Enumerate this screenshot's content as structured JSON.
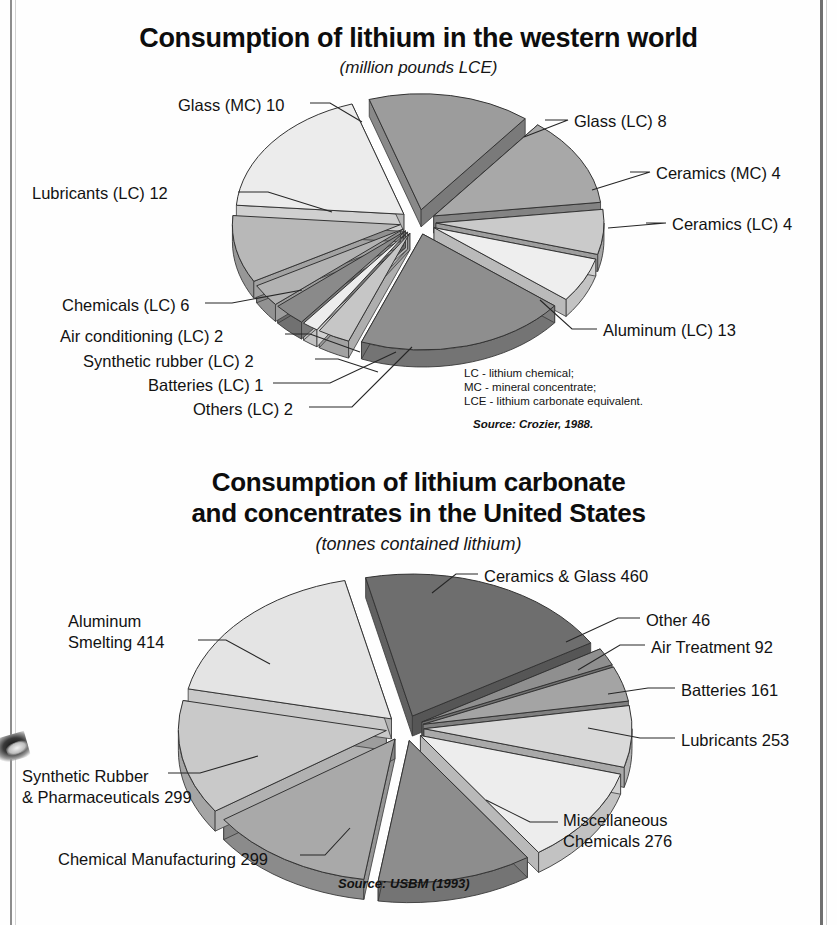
{
  "page": {
    "charts": [
      {
        "title": "Consumption of lithium in the western world",
        "subtitle": "(million pounds LCE)",
        "source": "Source: Crozier, 1988.",
        "note": "LC - lithium chemical;\nMC - mineral concentrate;\nLCE - lithium carbonate equivalent.",
        "labels": {
          "glass_mc": "Glass (MC) 10",
          "lubricants": "Lubricants (LC) 12",
          "chemicals": "Chemicals (LC) 6",
          "air_conditioning": "Air conditioning (LC) 2",
          "synthetic_rubber": "Synthetic rubber (LC) 2",
          "batteries": "Batteries (LC) 1",
          "others": "Others (LC) 2",
          "glass_lc": "Glass (LC) 8",
          "ceramics_mc": "Ceramics (MC) 4",
          "ceramics_lc": "Ceramics (LC) 4",
          "aluminum": "Aluminum (LC) 13"
        }
      },
      {
        "title_line1": "Consumption of lithium carbonate",
        "title_line2": "and concentrates in the United States",
        "subtitle": "(tonnes contained lithium)",
        "source": "Source: USBM (1993)",
        "labels": {
          "ceramics_glass": "Ceramics & Glass 460",
          "other": "Other 46",
          "air_treatment": "Air Treatment 92",
          "batteries": "Batteries 161",
          "lubricants": "Lubricants 253",
          "misc_chem_l1": "Miscellaneous",
          "misc_chem_l2": "Chemicals 276",
          "chem_mfg": "Chemical Manufacturing 299",
          "syn_rubber_l1": "Synthetic Rubber",
          "syn_rubber_l2": "& Pharmaceuticals 299",
          "aluminum_l1": "Aluminum",
          "aluminum_l2": "Smelting 414"
        }
      }
    ]
  },
  "chart_data": [
    {
      "type": "pie",
      "title": "Consumption of lithium in the western world",
      "subtitle": "(million pounds LCE)",
      "unit": "million pounds LCE",
      "exploded": true,
      "three_d": true,
      "source": "Crozier, 1988",
      "categories": [
        "Glass (MC)",
        "Glass (LC)",
        "Ceramics (MC)",
        "Ceramics (LC)",
        "Aluminum (LC)",
        "Others (LC)",
        "Batteries (LC)",
        "Synthetic rubber (LC)",
        "Air conditioning (LC)",
        "Chemicals (LC)",
        "Lubricants (LC)"
      ],
      "values": [
        10,
        8,
        4,
        4,
        13,
        2,
        1,
        2,
        2,
        6,
        12
      ],
      "slices": [
        {
          "label": "Glass (MC) 10",
          "name": "Glass (MC)",
          "value": 10,
          "color": "#9c9c9c"
        },
        {
          "label": "Glass (LC) 8",
          "name": "Glass (LC)",
          "value": 8,
          "color": "#a8a8a8"
        },
        {
          "label": "Ceramics (MC) 4",
          "name": "Ceramics (MC)",
          "value": 4,
          "color": "#cacaca"
        },
        {
          "label": "Ceramics (LC) 4",
          "name": "Ceramics (LC)",
          "value": 4,
          "color": "#eeeeee"
        },
        {
          "label": "Aluminum (LC) 13",
          "name": "Aluminum (LC)",
          "value": 13,
          "color": "#8e8e8e"
        },
        {
          "label": "Others (LC) 2",
          "name": "Others (LC)",
          "value": 2,
          "color": "#c6c6c6"
        },
        {
          "label": "Batteries (LC) 1",
          "name": "Batteries (LC)",
          "value": 1,
          "color": "#ededed"
        },
        {
          "label": "Synthetic rubber (LC) 2",
          "name": "Synthetic rubber (LC)",
          "value": 2,
          "color": "#8a8a8a"
        },
        {
          "label": "Air conditioning (LC) 2",
          "name": "Air conditioning (LC)",
          "value": 2,
          "color": "#b2b2b2"
        },
        {
          "label": "Chemicals (LC) 6",
          "name": "Chemicals (LC)",
          "value": 6,
          "color": "#b8b8b8"
        },
        {
          "label": "Lubricants (LC) 12",
          "name": "Lubricants (LC)",
          "value": 12,
          "color": "#ececec"
        }
      ],
      "total": 64,
      "legend_note": "LC - lithium chemical; MC - mineral concentrate; LCE - lithium carbonate equivalent."
    },
    {
      "type": "pie",
      "title": "Consumption of lithium carbonate and concentrates in the United States",
      "subtitle": "(tonnes contained lithium)",
      "unit": "tonnes contained lithium",
      "exploded": true,
      "three_d": true,
      "source": "USBM (1993)",
      "categories": [
        "Ceramics & Glass",
        "Other",
        "Air Treatment",
        "Batteries",
        "Lubricants",
        "Miscellaneous Chemicals",
        "Chemical Manufacturing",
        "Synthetic Rubber & Pharmaceuticals",
        "Aluminum Smelting"
      ],
      "values": [
        460,
        46,
        92,
        161,
        253,
        276,
        299,
        299,
        414
      ],
      "slices": [
        {
          "label": "Ceramics & Glass 460",
          "name": "Ceramics & Glass",
          "value": 460,
          "color": "#6e6e6e"
        },
        {
          "label": "Other 46",
          "name": "Other",
          "value": 46,
          "color": "#8f8f8f"
        },
        {
          "label": "Air Treatment 92",
          "name": "Air Treatment",
          "value": 92,
          "color": "#a4a4a4"
        },
        {
          "label": "Batteries 161",
          "name": "Batteries",
          "value": 161,
          "color": "#d9d9d9"
        },
        {
          "label": "Lubricants 253",
          "name": "Lubricants",
          "value": 253,
          "color": "#ededed"
        },
        {
          "label": "Miscellaneous Chemicals 276",
          "name": "Miscellaneous Chemicals",
          "value": 276,
          "color": "#8d8d8d"
        },
        {
          "label": "Chemical Manufacturing 299",
          "name": "Chemical Manufacturing",
          "value": 299,
          "color": "#a9a9a9"
        },
        {
          "label": "Synthetic Rubber & Pharmaceuticals 299",
          "name": "Synthetic Rubber & Pharmaceuticals",
          "value": 299,
          "color": "#c9c9c9"
        },
        {
          "label": "Aluminum Smelting 414",
          "name": "Aluminum Smelting",
          "value": 414,
          "color": "#e4e4e4"
        }
      ],
      "total": 2300
    }
  ]
}
